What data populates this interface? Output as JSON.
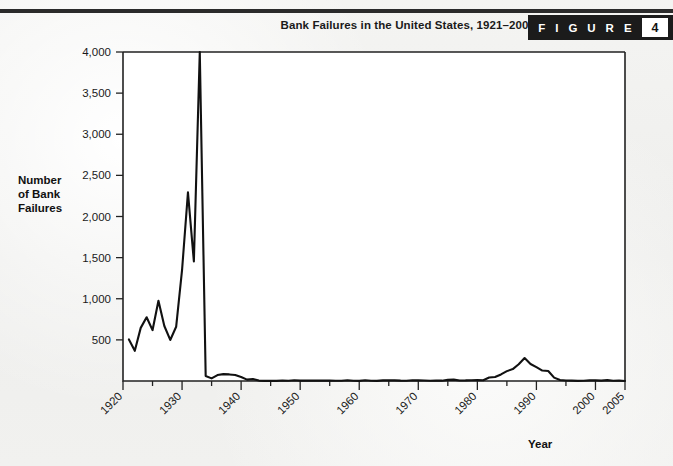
{
  "header": {
    "title": "Bank Failures in the United States, 1921–2005",
    "figure_word": "F I G U R E",
    "figure_number": "4"
  },
  "colors": {
    "page_background": "#f1f1ef",
    "rule": "#2b2b2b",
    "badge_background": "#1b1b1b",
    "badge_number_background": "#ffffff",
    "plot_background": "#ffffff",
    "line": "#111111",
    "axis": "#222222",
    "text": "#1a1a1a"
  },
  "chart_data": {
    "type": "line",
    "title": "Bank Failures in the United States, 1921–2005",
    "xlabel": "Year",
    "ylabel": "Number of Bank Failures",
    "ylabel_lines": [
      "Number",
      "of Bank",
      "Failures"
    ],
    "grid": false,
    "legend": "none",
    "xlim": [
      1920,
      2005
    ],
    "ylim": [
      0,
      4000
    ],
    "ytick_labels": [
      "500",
      "1,000",
      "1,500",
      "2,000",
      "2,500",
      "3,000",
      "3,500",
      "4,000"
    ],
    "yticks": [
      500,
      1000,
      1500,
      2000,
      2500,
      3000,
      3500,
      4000
    ],
    "xtick_labels": [
      "1920",
      "1930",
      "1940",
      "1950",
      "1960",
      "1970",
      "1980",
      "1990",
      "2000",
      "2005"
    ],
    "xticks": [
      1920,
      1930,
      1940,
      1950,
      1960,
      1970,
      1980,
      1990,
      2000,
      2005
    ],
    "xtick_rotation_deg": 45,
    "series": [
      {
        "name": "Bank failures",
        "x": [
          1921,
          1922,
          1923,
          1924,
          1925,
          1926,
          1927,
          1928,
          1929,
          1930,
          1931,
          1932,
          1933,
          1934,
          1935,
          1936,
          1937,
          1938,
          1939,
          1940,
          1941,
          1942,
          1943,
          1944,
          1945,
          1946,
          1947,
          1948,
          1949,
          1950,
          1951,
          1952,
          1953,
          1954,
          1955,
          1956,
          1957,
          1958,
          1959,
          1960,
          1961,
          1962,
          1963,
          1964,
          1965,
          1966,
          1967,
          1968,
          1969,
          1970,
          1971,
          1972,
          1973,
          1974,
          1975,
          1976,
          1977,
          1978,
          1979,
          1980,
          1981,
          1982,
          1983,
          1984,
          1985,
          1986,
          1987,
          1988,
          1989,
          1990,
          1991,
          1992,
          1993,
          1994,
          1995,
          1996,
          1997,
          1998,
          1999,
          2000,
          2001,
          2002,
          2003,
          2004,
          2005
        ],
        "values": [
          505,
          367,
          646,
          775,
          618,
          976,
          669,
          499,
          659,
          1350,
          2293,
          1453,
          4000,
          61,
          32,
          72,
          84,
          80,
          72,
          48,
          17,
          23,
          5,
          2,
          1,
          1,
          6,
          3,
          9,
          5,
          5,
          4,
          5,
          4,
          5,
          3,
          3,
          9,
          3,
          2,
          9,
          3,
          2,
          8,
          9,
          8,
          4,
          3,
          9,
          8,
          6,
          3,
          6,
          4,
          14,
          17,
          6,
          7,
          10,
          11,
          10,
          42,
          48,
          80,
          120,
          145,
          203,
          279,
          207,
          169,
          127,
          122,
          41,
          13,
          6,
          5,
          1,
          3,
          8,
          7,
          4,
          11,
          3,
          4,
          0
        ]
      }
    ],
    "annotations": [
      {
        "text": "Peak of 4,000 bank failures in 1933",
        "x": 1933,
        "y": 4000
      },
      {
        "text": "Savings and loan crisis bump peaking near 1988",
        "x": 1988,
        "y": 279
      }
    ]
  }
}
